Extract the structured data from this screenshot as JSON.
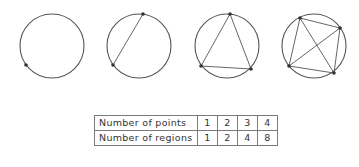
{
  "diagram": {
    "stroke_color": "#555555",
    "point_color": "#333333",
    "circles": [
      {
        "id": "circle-1",
        "cx": 52,
        "cy": 46,
        "r": 32,
        "points": [
          [
            26,
            65
          ]
        ]
      },
      {
        "id": "circle-2",
        "cx": 139,
        "cy": 46,
        "r": 32,
        "points": [
          [
            143,
            14
          ],
          [
            113,
            65
          ]
        ]
      },
      {
        "id": "circle-3",
        "cx": 227,
        "cy": 46,
        "r": 32,
        "points": [
          [
            230,
            14
          ],
          [
            201,
            66
          ],
          [
            251,
            69
          ]
        ]
      },
      {
        "id": "circle-4",
        "cx": 314,
        "cy": 46,
        "r": 32,
        "points": [
          [
            300,
            18
          ],
          [
            340,
            28
          ],
          [
            334,
            73
          ],
          [
            289,
            66
          ]
        ]
      }
    ]
  },
  "table": {
    "rows": [
      {
        "label": "Number of points",
        "values": [
          "1",
          "2",
          "3",
          "4"
        ]
      },
      {
        "label": "Number of regions",
        "values": [
          "1",
          "2",
          "4",
          "8"
        ]
      }
    ]
  }
}
